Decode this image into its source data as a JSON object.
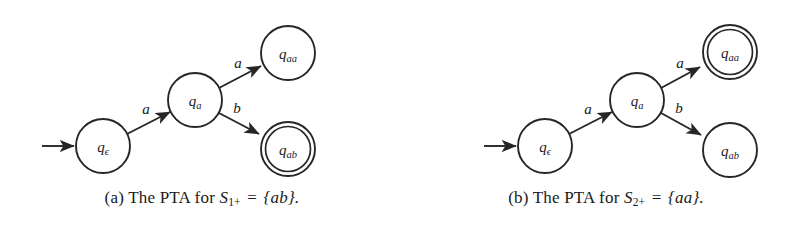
{
  "figure": {
    "subfigures": [
      {
        "tag": "(a)",
        "caption_text": "(a) The PTA for S",
        "caption_prefix": "(a)",
        "caption_words": "The PTA for",
        "set_symbol": "S",
        "set_subscript": "1+",
        "equals": "=",
        "set_value": "{ab}.",
        "caption_full": "(a) The PTA for S1+ = {ab}.",
        "nodes": [
          {
            "id": "q-epsilon",
            "label_main": "q",
            "label_sub": "ϵ",
            "x": 103,
            "y": 146,
            "r": 27,
            "accepting": false,
            "start": true
          },
          {
            "id": "q-a",
            "label_main": "q",
            "label_sub": "a",
            "x": 195,
            "y": 100,
            "r": 27,
            "accepting": false,
            "start": false
          },
          {
            "id": "q-aa",
            "label_main": "q",
            "label_sub": "aa",
            "x": 288,
            "y": 53,
            "r": 27,
            "accepting": false,
            "start": false
          },
          {
            "id": "q-ab",
            "label_main": "q",
            "label_sub": "ab",
            "x": 288,
            "y": 149,
            "r": 27,
            "accepting": true,
            "start": false
          }
        ],
        "edges": [
          {
            "from": "q-epsilon",
            "to": "q-a",
            "label": "a",
            "label_x": 146,
            "label_y": 109
          },
          {
            "from": "q-a",
            "to": "q-aa",
            "label": "a",
            "label_x": 238,
            "label_y": 63
          },
          {
            "from": "q-a",
            "to": "q-ab",
            "label": "b",
            "label_x": 237,
            "label_y": 108
          }
        ],
        "start_arrow": {
          "x1": 42,
          "y1": 146,
          "x2": 74,
          "y2": 146
        }
      },
      {
        "tag": "(b)",
        "caption_text": "(b) The PTA for S",
        "caption_prefix": "(b)",
        "caption_words": "The PTA for",
        "set_symbol": "S",
        "set_subscript": "2+",
        "equals": "=",
        "set_value": "{aa}.",
        "caption_full": "(b) The PTA for S2+ = {aa}.",
        "nodes": [
          {
            "id": "q-epsilon",
            "label_main": "q",
            "label_sub": "ϵ",
            "x": 141,
            "y": 146,
            "r": 27,
            "accepting": false,
            "start": true
          },
          {
            "id": "q-a",
            "label_main": "q",
            "label_sub": "a",
            "x": 233,
            "y": 100,
            "r": 27,
            "accepting": false,
            "start": false
          },
          {
            "id": "q-aa",
            "label_main": "q",
            "label_sub": "aa",
            "x": 326,
            "y": 52,
            "r": 27,
            "accepting": true,
            "start": false
          },
          {
            "id": "q-ab",
            "label_main": "q",
            "label_sub": "ab",
            "x": 326,
            "y": 150,
            "r": 27,
            "accepting": false,
            "start": false
          }
        ],
        "edges": [
          {
            "from": "q-epsilon",
            "to": "q-a",
            "label": "a",
            "label_x": 184,
            "label_y": 109
          },
          {
            "from": "q-a",
            "to": "q-aa",
            "label": "a",
            "label_x": 276,
            "label_y": 63
          },
          {
            "from": "q-a",
            "to": "q-ab",
            "label": "b",
            "label_x": 275,
            "label_y": 108
          }
        ],
        "start_arrow": {
          "x1": 80,
          "y1": 146,
          "x2": 112,
          "y2": 146
        }
      }
    ]
  },
  "colors": {
    "background": "#ffffff",
    "stroke": "#262626",
    "text": "#1a1a1a"
  }
}
